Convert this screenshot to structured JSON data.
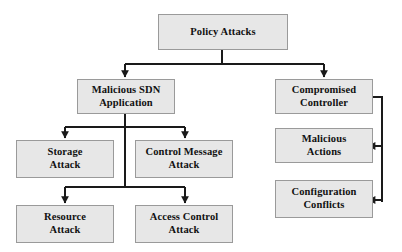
{
  "diagram": {
    "type": "tree-hierarchy",
    "title": "Policy Attacks",
    "canvas": {
      "width": 402,
      "height": 252
    },
    "style": {
      "node_fill": "#e7e7e7",
      "node_border": "#9a9a9a",
      "connector_color": "#1a1a1a",
      "text_color": "#111111",
      "background": "#ffffff"
    },
    "nodes": [
      {
        "id": "policy_attacks",
        "label": "Policy Attacks",
        "level": 0
      },
      {
        "id": "malicious_sdn_app",
        "label": "Malicious SDN\nApplication",
        "level": 1
      },
      {
        "id": "compromised_ctrl",
        "label": "Compromised\nController",
        "level": 1
      },
      {
        "id": "storage_attack",
        "label": "Storage\nAttack",
        "level": 2
      },
      {
        "id": "control_msg_attack",
        "label": "Control Message\nAttack",
        "level": 2
      },
      {
        "id": "resource_attack",
        "label": "Resource\nAttack",
        "level": 2
      },
      {
        "id": "access_ctrl_attack",
        "label": "Access Control\nAttack",
        "level": 2
      },
      {
        "id": "malicious_actions",
        "label": "Malicious\nActions",
        "level": 2
      },
      {
        "id": "config_conflicts",
        "label": "Configuration\nConflicts",
        "level": 2
      }
    ],
    "edges": [
      {
        "from": "policy_attacks",
        "to": "malicious_sdn_app",
        "arrow": "down"
      },
      {
        "from": "policy_attacks",
        "to": "compromised_ctrl",
        "arrow": "down"
      },
      {
        "from": "malicious_sdn_app",
        "to": "storage_attack",
        "arrow": "down"
      },
      {
        "from": "malicious_sdn_app",
        "to": "control_msg_attack",
        "arrow": "down"
      },
      {
        "from": "malicious_sdn_app",
        "to": "resource_attack",
        "arrow": "down"
      },
      {
        "from": "malicious_sdn_app",
        "to": "access_ctrl_attack",
        "arrow": "down"
      },
      {
        "from": "compromised_ctrl",
        "to": "malicious_actions",
        "arrow": "left"
      },
      {
        "from": "compromised_ctrl",
        "to": "config_conflicts",
        "arrow": "left"
      }
    ]
  }
}
